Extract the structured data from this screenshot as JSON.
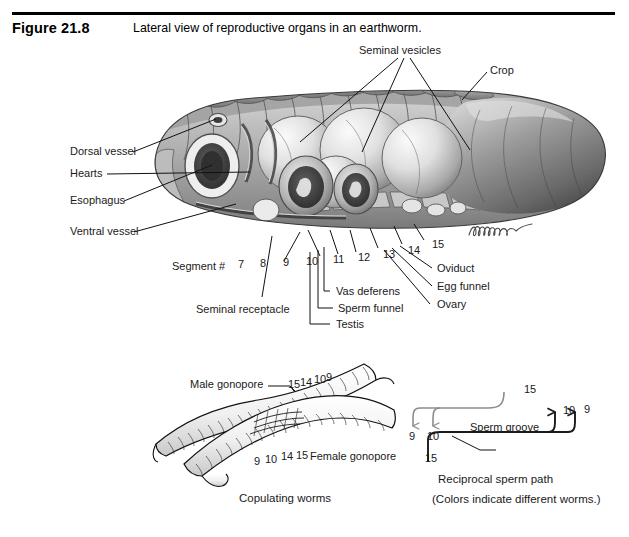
{
  "figure": {
    "number": "Figure 21.8",
    "caption": "Lateral view of reproductive organs in an earthworm."
  },
  "main_illustration": {
    "name": "lateral-view-earthworm-reproductive-organs",
    "style": "graphite pencil anatomical drawing, grayscale",
    "labels": {
      "seminal_vesicles": "Seminal vesicles",
      "crop": "Crop",
      "dorsal_vessel": "Dorsal vessel",
      "hearts": "Hearts",
      "esophagus": "Esophagus",
      "ventral_vessel": "Ventral vessel",
      "seminal_receptacle": "Seminal receptacle",
      "vas_deferens": "Vas deferens",
      "sperm_funnel": "Sperm funnel",
      "testis": "Testis",
      "oviduct": "Oviduct",
      "egg_funnel": "Egg funnel",
      "ovary": "Ovary"
    },
    "segment_label": "Segment  #",
    "segment_numbers": [
      "7",
      "8",
      "9",
      "10",
      "11",
      "12",
      "13",
      "14",
      "15"
    ],
    "signature": "artist-signature"
  },
  "copulating_panel": {
    "caption": "Copulating worms",
    "labels": {
      "male_gonopore": "Male gonopore",
      "female_gonopore": "Female gonopore"
    },
    "upper_worm_numbers": [
      "15",
      "14",
      "10",
      "9"
    ],
    "lower_worm_numbers": [
      "9",
      "10",
      "14",
      "15"
    ]
  },
  "sperm_path_panel": {
    "caption": "Reciprocal sperm path",
    "note": "(Colors indicate different worms.)",
    "groove_label": "Sperm groove",
    "gray_path": {
      "color": "#8d8d8d",
      "source": "15",
      "targets": [
        "9",
        "10"
      ]
    },
    "black_path": {
      "color": "#1a1a1a",
      "source": "15",
      "targets": [
        "10",
        "9"
      ]
    }
  },
  "colors": {
    "rule": "#000000",
    "text": "#1a1a1a",
    "gray_path": "#8d8d8d",
    "black_path": "#1a1a1a"
  }
}
